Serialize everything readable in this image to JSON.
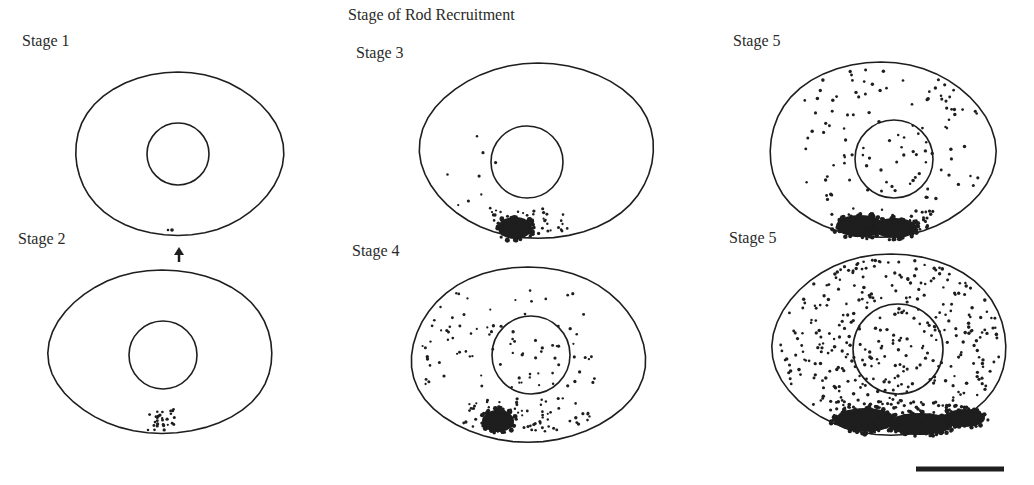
{
  "figure": {
    "title": "Stage of Rod Recruitment",
    "ink_color": "#1e1e1e",
    "panels": [
      {
        "id": "stage1",
        "label": "Stage 1",
        "label_x": 22,
        "label_y": 46,
        "cell": {
          "cx": 178,
          "cy": 155,
          "rx": 104,
          "ry": 83
        },
        "nucleus": {
          "cx": 178,
          "cy": 154,
          "r": 31
        },
        "dot_density": "sparse",
        "clusters": [
          "2 dots at bottom near arrow"
        ]
      },
      {
        "id": "stage2",
        "label": "Stage 2",
        "label_x": 18,
        "label_y": 244,
        "cell": {
          "cx": 162,
          "cy": 353,
          "rx": 112,
          "ry": 83
        },
        "nucleus": {
          "cx": 163,
          "cy": 355,
          "r": 34
        },
        "dot_density": "small bottom cluster"
      },
      {
        "id": "stage3",
        "label": "Stage 3",
        "label_x": 356,
        "label_y": 58,
        "cell": {
          "cx": 538,
          "cy": 152,
          "rx": 117,
          "ry": 89
        },
        "nucleus": {
          "cx": 527,
          "cy": 162,
          "r": 36
        },
        "dot_density": "dense dark patch at bottom with few scattered dots"
      },
      {
        "id": "stage4",
        "label": "Stage 4",
        "label_x": 352,
        "label_y": 256,
        "cell": {
          "cx": 528,
          "cy": 356,
          "rx": 117,
          "ry": 89
        },
        "nucleus": {
          "cx": 531,
          "cy": 355,
          "r": 39
        },
        "dot_density": "dark bottom patch and many scattered dots"
      },
      {
        "id": "stage5a",
        "label": "Stage 5",
        "label_x": 733,
        "label_y": 46,
        "cell": {
          "cx": 881,
          "cy": 151,
          "rx": 113,
          "ry": 89
        },
        "nucleus": {
          "cx": 894,
          "cy": 159,
          "r": 39
        },
        "dot_density": "broad dark bottom band and many scattered dots"
      },
      {
        "id": "stage5b",
        "label": "Stage 5",
        "label_x": 729,
        "label_y": 243,
        "cell": {
          "cx": 891,
          "cy": 346,
          "rx": 117,
          "ry": 92
        },
        "nucleus": {
          "cx": 898,
          "cy": 349,
          "r": 45
        },
        "dot_density": "dense throughout with thick bottom band"
      }
    ],
    "arrow": {
      "x": 179,
      "y_top": 247,
      "y_bottom": 262,
      "direction": "up"
    },
    "scale_bar": {
      "x1": 916,
      "x2": 1004,
      "y": 469,
      "thickness": 5
    }
  }
}
